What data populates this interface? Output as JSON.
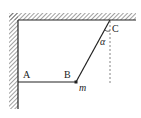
{
  "diagram": {
    "type": "physics-mechanics",
    "labels": {
      "A": "A",
      "B": "B",
      "C": "C",
      "mass": "m",
      "angle": "α"
    },
    "colors": {
      "line": "#222222",
      "hatch": "#444444",
      "dashed": "#666666"
    }
  }
}
